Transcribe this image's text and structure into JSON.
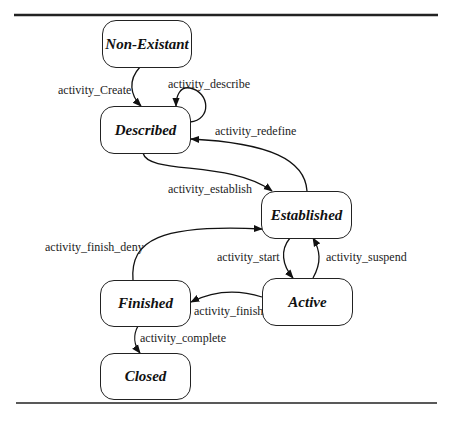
{
  "states": {
    "non_existant": "Non-Existant",
    "described": "Described",
    "established": "Established",
    "active": "Active",
    "finished": "Finished",
    "closed": "Closed"
  },
  "transitions": {
    "create": "activity_Create",
    "describe": "activity_describe",
    "redefine": "activity_redefine",
    "establish": "activity_establish",
    "finish_deny": "activity_finish_deny",
    "start": "activity_start",
    "suspend": "activity_suspend",
    "finish": "activity_finish",
    "complete": "activity_complete"
  }
}
